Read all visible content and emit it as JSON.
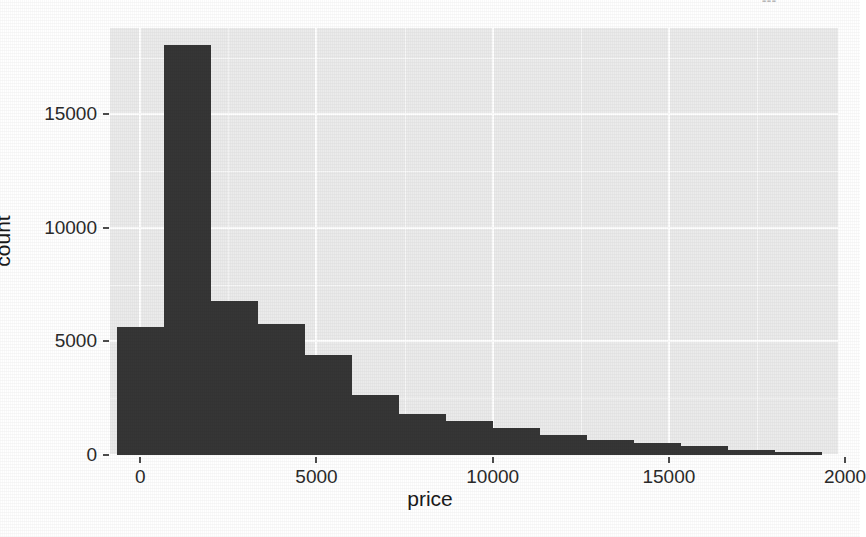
{
  "page": {
    "artifact_text": "---"
  },
  "chart_data": {
    "type": "bar",
    "subtype": "histogram",
    "title": "",
    "xlabel": "price",
    "ylabel": "count",
    "xlim": [
      -860,
      19800
    ],
    "ylim": [
      0,
      18800
    ],
    "grid": true,
    "legend": null,
    "bar_fill_color": "#363636",
    "panel_background": "#ebebeb",
    "gridline_color": "#ffffff",
    "binwidth": 1333,
    "x_ticks": [
      0,
      5000,
      10000,
      15000,
      20000
    ],
    "x_ticklabels": [
      "0",
      "5000",
      "10000",
      "15000",
      "2000"
    ],
    "y_ticks": [
      0,
      5000,
      10000,
      15000
    ],
    "y_ticklabels": [
      "0",
      "5000",
      "10000",
      "15000"
    ],
    "bins": [
      {
        "x_left": -650,
        "x_right": 683,
        "center": 17,
        "count": 5650
      },
      {
        "x_left": 683,
        "x_right": 2017,
        "center": 1350,
        "count": 18050
      },
      {
        "x_left": 2017,
        "x_right": 3350,
        "center": 2683,
        "count": 6800
      },
      {
        "x_left": 3350,
        "x_right": 4683,
        "center": 4017,
        "count": 5750
      },
      {
        "x_left": 4683,
        "x_right": 6017,
        "center": 5350,
        "count": 4400
      },
      {
        "x_left": 6017,
        "x_right": 7350,
        "center": 6683,
        "count": 2650
      },
      {
        "x_left": 7350,
        "x_right": 8683,
        "center": 8017,
        "count": 1820
      },
      {
        "x_left": 8683,
        "x_right": 10017,
        "center": 9350,
        "count": 1500
      },
      {
        "x_left": 10017,
        "x_right": 11350,
        "center": 10683,
        "count": 1170
      },
      {
        "x_left": 11350,
        "x_right": 12683,
        "center": 12017,
        "count": 880
      },
      {
        "x_left": 12683,
        "x_right": 14017,
        "center": 13350,
        "count": 650
      },
      {
        "x_left": 14017,
        "x_right": 15350,
        "center": 14683,
        "count": 515
      },
      {
        "x_left": 15350,
        "x_right": 16683,
        "center": 16017,
        "count": 375
      },
      {
        "x_left": 16683,
        "x_right": 18017,
        "center": 17350,
        "count": 235
      },
      {
        "x_left": 18017,
        "x_right": 19350,
        "center": 18683,
        "count": 140
      }
    ]
  }
}
